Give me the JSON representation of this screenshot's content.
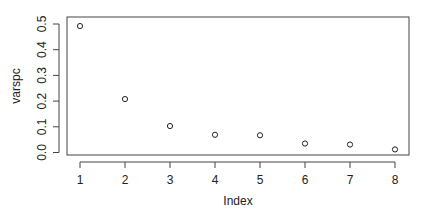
{
  "chart_data": {
    "type": "scatter",
    "title": "",
    "xlabel": "Index",
    "ylabel": "varspc",
    "x": [
      1,
      2,
      3,
      4,
      5,
      6,
      7,
      8
    ],
    "values": [
      0.492,
      0.208,
      0.103,
      0.069,
      0.067,
      0.035,
      0.031,
      0.012
    ],
    "xticks": [
      "1",
      "2",
      "3",
      "4",
      "5",
      "6",
      "7",
      "8"
    ],
    "yticks": [
      "0.0",
      "0.1",
      "0.2",
      "0.3",
      "0.4",
      "0.5"
    ],
    "xlim": [
      0.7,
      8.3
    ],
    "ylim": [
      -0.01,
      0.51
    ],
    "grid": false,
    "legend": null,
    "marker": "open-circle"
  }
}
